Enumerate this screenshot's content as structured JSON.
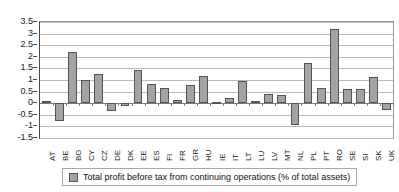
{
  "chart_data": {
    "type": "bar",
    "title": "",
    "subtitle": "",
    "xlabel": "",
    "ylabel": "",
    "ylim": [
      -1.5,
      3.5
    ],
    "ytick_labels": [
      "3.5",
      "3",
      "2.5",
      "2",
      "1.5",
      "1",
      "0.5",
      "0",
      "-0.5",
      "-1",
      "-1.5"
    ],
    "ytick_values": [
      3.5,
      3,
      2.5,
      2,
      1.5,
      1,
      0.5,
      0,
      -0.5,
      -1,
      -1.5
    ],
    "grid": true,
    "legend_position": "bottom",
    "categories": [
      "AT",
      "BE",
      "BG",
      "CY",
      "CZ",
      "DE",
      "DK",
      "EE",
      "ES",
      "FI",
      "FR",
      "GR",
      "HU",
      "IE",
      "IT",
      "LT",
      "LU",
      "LV",
      "MT",
      "NL",
      "PL",
      "PT",
      "RO",
      "SE",
      "SI",
      "SK",
      "UK"
    ],
    "values": [
      0.08,
      -0.78,
      2.2,
      1.0,
      1.28,
      -0.35,
      -0.1,
      1.45,
      0.82,
      0.65,
      0.13,
      0.78,
      1.18,
      0.06,
      0.23,
      0.95,
      0.08,
      0.4,
      0.37,
      -0.95,
      1.73,
      0.67,
      3.18,
      0.62,
      0.6,
      1.12,
      -0.28
    ],
    "series": [
      {
        "name": "Total profit before tax from continuing operations (% of total assets)",
        "color": "#a3a3a3",
        "values": [
          0.08,
          -0.78,
          2.2,
          1.0,
          1.28,
          -0.35,
          -0.1,
          1.45,
          0.82,
          0.65,
          0.13,
          0.78,
          1.18,
          0.06,
          0.23,
          0.95,
          0.08,
          0.4,
          0.37,
          -0.95,
          1.73,
          0.67,
          3.18,
          0.62,
          0.6,
          1.12,
          -0.28
        ]
      }
    ]
  },
  "legend": {
    "label": "Total profit before tax from continuing operations (% of total assets)",
    "swatch_color": "#a3a3a3"
  },
  "colors": {
    "bar_fill": "#a3a3a3",
    "bar_border": "#555555",
    "gridline": "#b9b9b9",
    "axis": "#4a4a4a",
    "text": "#1a1a1a"
  }
}
